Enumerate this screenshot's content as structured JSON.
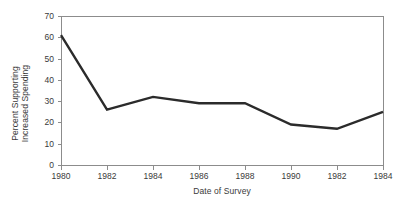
{
  "chart_data": {
    "type": "line",
    "title": "",
    "subtitle": "",
    "xlabel": "Date of Survey",
    "ylabel": "Percent Supporting\nIncreased Spending",
    "ylabel_line1": "Percent Supporting",
    "ylabel_line2": "Increased Spending",
    "categories": [
      "1980",
      "1982",
      "1984",
      "1986",
      "1988",
      "1990",
      "1982",
      "1984"
    ],
    "values": [
      61,
      26,
      32,
      29,
      29,
      19,
      17,
      25
    ],
    "series": [
      {
        "name": "Percent Supporting Increased Spending",
        "values": [
          61,
          26,
          32,
          29,
          29,
          19,
          17,
          25
        ]
      }
    ],
    "xtick_labels": [
      "1980",
      "1982",
      "1984",
      "1986",
      "1988",
      "1990",
      "1982",
      "1984"
    ],
    "ytick_labels": [
      "0",
      "10",
      "20",
      "30",
      "40",
      "50",
      "60",
      "70"
    ],
    "ytick_values": [
      0,
      10,
      20,
      30,
      40,
      50,
      60,
      70
    ],
    "ylim": [
      0,
      70
    ],
    "ystep": 10,
    "grid": false,
    "legend": false,
    "legend_position": "none",
    "annotations": [],
    "line_color": "#2b2b2b",
    "line_width": 2.4,
    "markers": false,
    "axis_color": "#8c8c8c",
    "background_color": "#ffffff",
    "text_color": "#3a3a3a"
  },
  "figure": {
    "plot_left": 61,
    "plot_right": 383,
    "plot_top": 16,
    "plot_bottom": 165
  }
}
